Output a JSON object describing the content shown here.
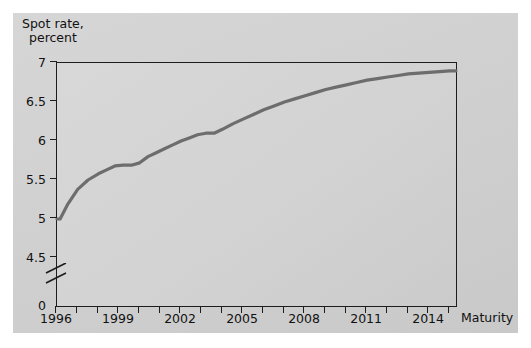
{
  "figure": {
    "panel_bg": "#d2d2d2",
    "plot_bg": "#d4d4d4",
    "axis_color": "#1d1d1d",
    "line_color": "#6d6d6d"
  },
  "chart_data": {
    "type": "line",
    "title": "",
    "ylabel_line1": "Spot rate,",
    "ylabel_line2": "percent",
    "xlabel": "Maturity",
    "ylim": [
      4.5,
      7
    ],
    "yticks": [
      0,
      4.5,
      5,
      5.5,
      6,
      6.5,
      7
    ],
    "ytick_labels": [
      "0",
      "4.5",
      "5",
      "5.5",
      "6",
      "6.5",
      "7"
    ],
    "y_axis_break": true,
    "y_axis_break_between": [
      0,
      4.5
    ],
    "grid": false,
    "legend": null,
    "xlim": [
      1996,
      2015.3
    ],
    "xticks": [
      1996,
      1997,
      1998,
      1999,
      2000,
      2001,
      2002,
      2003,
      2004,
      2005,
      2006,
      2007,
      2008,
      2009,
      2010,
      2011,
      2012,
      2013,
      2014,
      2015
    ],
    "xtick_labels_shown": [
      "1996",
      "1999",
      "2002",
      "2005",
      "2008",
      "2011",
      "2014"
    ],
    "series": [
      {
        "name": "Spot rate",
        "x": [
          1996.0,
          1996.15,
          1996.5,
          1997.0,
          1997.5,
          1998.0,
          1998.4,
          1998.8,
          1999.2,
          1999.6,
          2000.0,
          2000.4,
          2000.8,
          2001.2,
          2001.6,
          2002.0,
          2002.4,
          2002.8,
          2003.2,
          2003.6,
          2004.0,
          2004.5,
          2005.0,
          2005.5,
          2006.0,
          2006.5,
          2007.0,
          2007.5,
          2008.0,
          2008.5,
          2009.0,
          2009.5,
          2010.0,
          2010.5,
          2011.0,
          2011.5,
          2012.0,
          2012.5,
          2013.0,
          2013.5,
          2014.0,
          2014.5,
          2015.0,
          2015.3
        ],
        "y": [
          5.0,
          5.0,
          5.18,
          5.38,
          5.5,
          5.58,
          5.63,
          5.68,
          5.69,
          5.69,
          5.72,
          5.8,
          5.85,
          5.9,
          5.95,
          6.0,
          6.04,
          6.08,
          6.1,
          6.1,
          6.15,
          6.22,
          6.28,
          6.34,
          6.4,
          6.45,
          6.5,
          6.54,
          6.58,
          6.62,
          6.66,
          6.69,
          6.72,
          6.75,
          6.78,
          6.8,
          6.82,
          6.84,
          6.86,
          6.87,
          6.88,
          6.89,
          6.9,
          6.9
        ]
      }
    ]
  }
}
